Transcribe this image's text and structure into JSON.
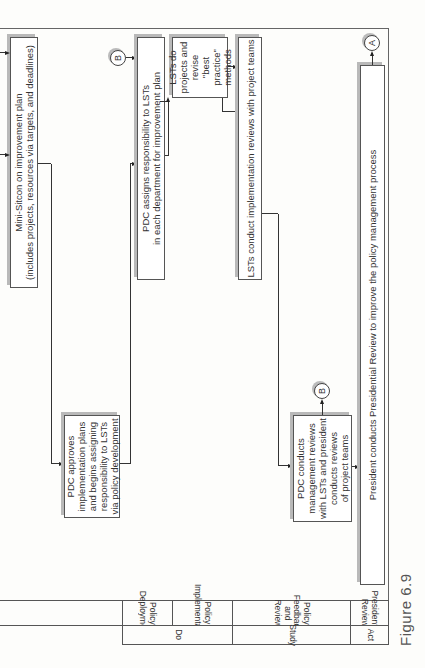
{
  "figure": {
    "caption": "Figure 6.9"
  },
  "lanes": {
    "phases": [
      {
        "label": "Do"
      },
      {
        "label": "Study"
      },
      {
        "label": "Act"
      }
    ],
    "swimlanes": [
      {
        "label": "Policy Deployment"
      },
      {
        "label": "Policy Implementation"
      },
      {
        "label": "Policy Feedback and Review"
      },
      {
        "label": "Presidential Review"
      }
    ]
  },
  "nodes": {
    "mini_sitcon": {
      "line1": "Mini-Sitcon on improvement plan",
      "line2": "(includes projects, resources via targets, and deadlines)"
    },
    "pdc_approves": {
      "lines": [
        "PDC approves",
        "implementation plans",
        "and begins assigning",
        "responsibility to LSTs",
        "via policy development"
      ]
    },
    "pdc_assigns": {
      "line1": "PDC assigns responsibility to LSTs",
      "line2": "in each department for improvement plan"
    },
    "lsts_do": {
      "lines": [
        "LSTs do",
        "projects and",
        "revise",
        "\"best practice\"",
        "methods"
      ]
    },
    "lsts_conduct": {
      "text": "LSTs conduct implementation reviews with  project teams"
    },
    "pdc_conducts": {
      "lines": [
        "PDC conducts",
        "management reviews",
        "with LSTs and president",
        "conducts reviews",
        "of project teams"
      ]
    },
    "president_review": {
      "text": "President conducts Presidential Review  to improve the policy management process"
    }
  },
  "connectors": {
    "b_top": "B",
    "b_mid": "B",
    "a_top": "A"
  }
}
